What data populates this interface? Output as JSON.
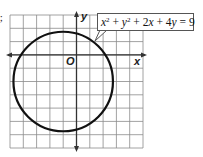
{
  "figure": {
    "cropped_prefix": ");",
    "equation": {
      "x": "x",
      "y": "y",
      "sq": "2",
      "plus1": " + ",
      "plus2": " + 2",
      "plus3": " + 4",
      "eq": " = 9"
    },
    "axis_labels": {
      "x": "x",
      "y": "y",
      "origin": "O"
    },
    "grid": {
      "x_min": -5,
      "x_max": 5,
      "y_min": -7,
      "y_max": 3
    },
    "circle": {
      "center": [
        -1,
        -2
      ],
      "radius_squared": 14
    },
    "colors": {
      "grid": "#8a8a8a",
      "axis": "#333333",
      "circle": "#111111"
    }
  }
}
